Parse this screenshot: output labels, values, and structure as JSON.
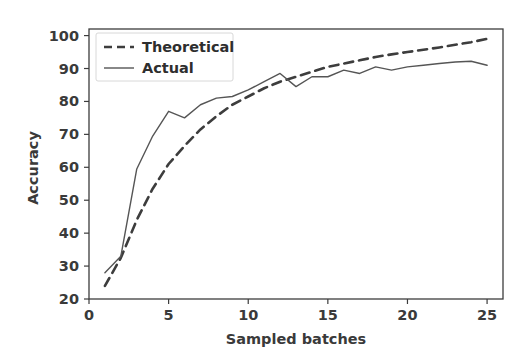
{
  "chart_data": {
    "type": "line",
    "title": "",
    "xlabel": "Sampled batches",
    "ylabel": "Accuracy",
    "xlim": [
      0,
      26
    ],
    "ylim": [
      20,
      102
    ],
    "xticks": [
      0,
      5,
      10,
      15,
      20,
      25
    ],
    "yticks": [
      20,
      30,
      40,
      50,
      60,
      70,
      80,
      90,
      100
    ],
    "grid": false,
    "legend_position": "upper left",
    "x": [
      1,
      2,
      3,
      4,
      5,
      6,
      7,
      8,
      9,
      10,
      11,
      12,
      13,
      14,
      15,
      16,
      17,
      18,
      19,
      20,
      21,
      22,
      23,
      24,
      25
    ],
    "series": [
      {
        "name": "Theoretical",
        "style": "dashed",
        "color": "#3d3d3d",
        "values": [
          24,
          32.5,
          44,
          53.5,
          61,
          66.5,
          71.5,
          75.5,
          79,
          81.5,
          84,
          86,
          87.5,
          89,
          90.5,
          91.5,
          92.5,
          93.5,
          94.3,
          95,
          95.7,
          96.4,
          97.2,
          98,
          99
        ]
      },
      {
        "name": "Actual",
        "style": "solid",
        "color": "#555555",
        "values": [
          28,
          33,
          59.5,
          69.5,
          77,
          75,
          79,
          81,
          81.5,
          83.5,
          86,
          88.5,
          84.5,
          87.5,
          87.5,
          89.5,
          88.5,
          90.5,
          89.5,
          90.5,
          91,
          91.5,
          92,
          92.2,
          91
        ]
      }
    ],
    "legend": [
      {
        "label": "Theoretical",
        "style": "dashed"
      },
      {
        "label": "Actual",
        "style": "solid"
      }
    ],
    "colors": {
      "background": "#ffffff",
      "axis": "#3c3c3c",
      "text": "#3a3a3a",
      "theoretical": "#3d3d3d",
      "actual": "#555555"
    }
  }
}
